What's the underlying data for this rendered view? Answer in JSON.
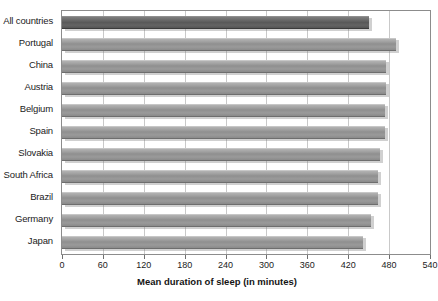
{
  "chart_data": {
    "type": "bar",
    "orientation": "horizontal",
    "title": "",
    "xlabel": "Mean duration of sleep (in minutes)",
    "ylabel": "",
    "xlim": [
      0,
      540
    ],
    "xticks": [
      0,
      60,
      120,
      180,
      240,
      300,
      360,
      420,
      480,
      540
    ],
    "grid": true,
    "categories": [
      "All countries",
      "Portugal",
      "China",
      "Austria",
      "Belgium",
      "Spain",
      "Slovakia",
      "South Africa",
      "Brazil",
      "Germany",
      "Japan"
    ],
    "values": [
      450,
      490,
      475,
      475,
      474,
      474,
      467,
      463,
      463,
      453,
      442
    ],
    "highlight_index": 0,
    "series": [
      {
        "name": "Mean duration of sleep (in minutes)",
        "values": [
          450,
          490,
          475,
          475,
          474,
          474,
          467,
          463,
          463,
          453,
          442
        ]
      }
    ],
    "legend": [],
    "colors": {
      "bar": "#959595",
      "bar_highlight": "#5d5d5d",
      "grid": "#c9c9c9",
      "frame": "#8c8c8c",
      "text": "#1b1b1b"
    }
  },
  "caption_fragment": ""
}
